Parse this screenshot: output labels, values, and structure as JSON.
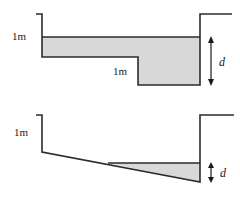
{
  "figure": {
    "background_color": "#ffffff",
    "line_color": "#2b2b2b",
    "water_fill_color": "#d8d8d8",
    "panels": [
      {
        "id": "top-panel",
        "name": "stepped-channel-panel",
        "description": "Channel with a stepped bed: shallow left shelf and deeper right section, filled with water to a level surface",
        "labels": [
          {
            "id": "top-left-depth-label",
            "name": "left-wall-depth-label",
            "text": "1m",
            "x": 12,
            "y": 40,
            "style": "upright"
          },
          {
            "id": "top-step-depth-label",
            "name": "step-depth-label",
            "text": "1m",
            "x": 113,
            "y": 75,
            "style": "upright"
          },
          {
            "id": "top-d-label",
            "name": "depth-d-label",
            "text": "d",
            "x": 221,
            "y": 66,
            "style": "italic"
          }
        ],
        "dimension": {
          "id": "top-d-dimension",
          "name": "depth-d-dimension-arrow",
          "label": "d",
          "x": 211,
          "y_top": 37,
          "y_bottom": 85,
          "orientation": "vertical",
          "arrowheads": "both"
        }
      },
      {
        "id": "bottom-panel",
        "name": "sloped-channel-panel",
        "description": "Channel with a bed sloping down from left to right, water collected as a wedge at the right end",
        "labels": [
          {
            "id": "bottom-left-depth-label",
            "name": "left-wall-depth-label",
            "text": "1m",
            "x": 14,
            "y": 136,
            "style": "upright"
          },
          {
            "id": "bottom-d-label",
            "name": "depth-d-label",
            "text": "d",
            "x": 222,
            "y": 177,
            "style": "italic"
          }
        ],
        "dimension": {
          "id": "bottom-d-dimension",
          "name": "depth-d-dimension-arrow",
          "label": "d",
          "x": 211,
          "y_top": 163,
          "y_bottom": 182,
          "orientation": "vertical",
          "arrowheads": "both"
        }
      }
    ],
    "geometry": {
      "top_outline_points": "36,14 42,14 42,57 138,57 138,85 200,85 200,14 232,14",
      "top_water_polygon": "42,37 200,37 200,85 138,85 138,57 42,57",
      "top_water_surface": "42,37 200,37",
      "bottom_outline_points": "36,115 42,115 42,152 200,182 200,115 234,115",
      "bottom_water_polygon": "108,163 200,163 200,182",
      "bottom_water_surface": "108,163 200,163"
    }
  }
}
